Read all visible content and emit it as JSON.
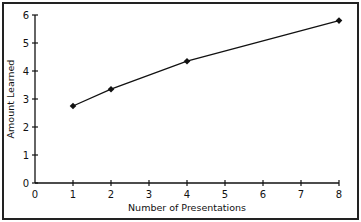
{
  "chart_data": {
    "type": "line",
    "title": "",
    "xlabel": "Number of Presentations",
    "ylabel": "Amount Learned",
    "x": [
      1,
      2,
      4,
      8
    ],
    "series": [
      {
        "name": "Amount Learned",
        "values": [
          2.75,
          3.35,
          4.35,
          5.8
        ]
      }
    ],
    "xlim": [
      0,
      8
    ],
    "ylim": [
      0,
      6
    ],
    "xticks": [
      "0",
      "1",
      "2",
      "3",
      "4",
      "5",
      "6",
      "7",
      "8"
    ],
    "yticks": [
      "0",
      "1",
      "2",
      "3",
      "4",
      "5",
      "6"
    ],
    "grid": false,
    "legend": "none",
    "marker": "filled-diamond"
  }
}
